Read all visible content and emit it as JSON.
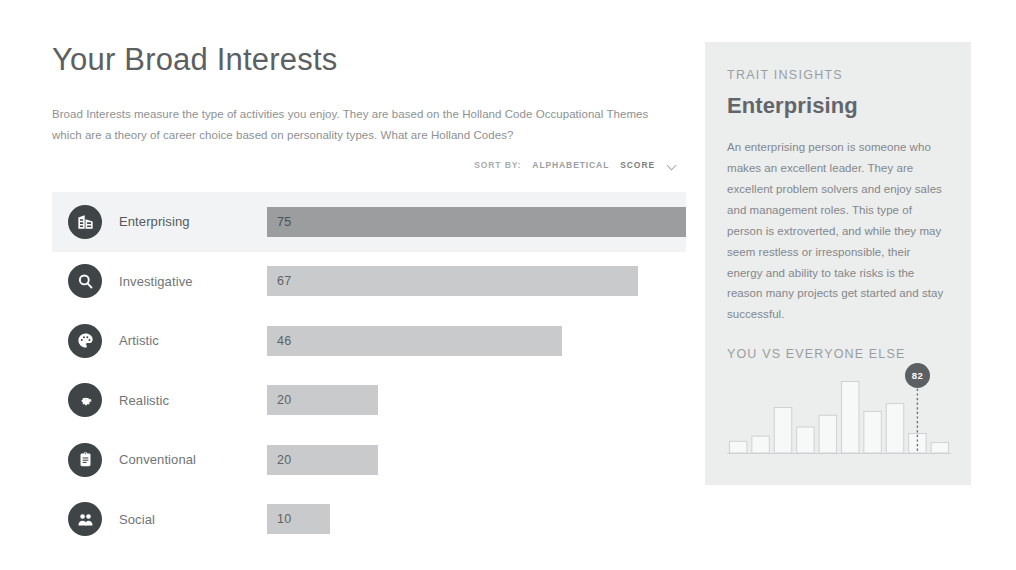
{
  "page": {
    "title": "Your Broad Interests",
    "intro_before_link": "Broad Interests measure the type of activities you enjoy. They are based on the Holland Code Occupational Themes which are a theory of career choice based on personality types. ",
    "intro_link": "What are Holland Codes?"
  },
  "sort": {
    "label": "SORT BY:",
    "options": [
      "ALPHABETICAL",
      "SCORE"
    ],
    "active": "SCORE",
    "chevron_icon": "chevron-down-icon"
  },
  "interests": [
    {
      "name": "Enterprising",
      "score": 75,
      "icon": "office-building-icon",
      "selected": true
    },
    {
      "name": "Investigative",
      "score": 67,
      "icon": "magnifier-icon",
      "selected": false
    },
    {
      "name": "Artistic",
      "score": 46,
      "icon": "palette-icon",
      "selected": false
    },
    {
      "name": "Realistic",
      "score": 20,
      "icon": "gear-icon",
      "selected": false
    },
    {
      "name": "Conventional",
      "score": 20,
      "icon": "clipboard-icon",
      "selected": false
    },
    {
      "name": "Social",
      "score": 10,
      "icon": "people-icon",
      "selected": false
    }
  ],
  "panel": {
    "kicker": "TRAIT INSIGHTS",
    "trait": "Enterprising",
    "description": "An enterprising person is someone who makes an excellent leader. They are excellent problem solvers and enjoy sales and management roles. This type of person is extroverted, and while they may seem restless or irresponsible, their energy and ability to take risks is the reason many projects get started and stay successful.",
    "comparison_heading": "YOU VS EVERYONE ELSE"
  },
  "chart_data": {
    "type": "bar",
    "title": "YOU VS EVERYONE ELSE",
    "xlabel": "",
    "ylabel": "",
    "categories": [
      "1",
      "2",
      "3",
      "4",
      "5",
      "6",
      "7",
      "8",
      "9",
      "10"
    ],
    "values": [
      9,
      13,
      35,
      20,
      29,
      55,
      32,
      38,
      15,
      8
    ],
    "ylim": [
      0,
      60
    ],
    "grid": false,
    "legend": null,
    "marker": {
      "label": "82",
      "bin_index": 8
    }
  },
  "colors": {
    "bar_default": "#c9cacb",
    "bar_selected": "#9b9d9f",
    "row_selected_bg": "#f2f3f4",
    "panel_bg": "#eceded",
    "icon_bg": "#3f4447",
    "badge_bg": "#5c6063",
    "text_primary": "#5d6063",
    "text_muted": "#8d9194"
  }
}
